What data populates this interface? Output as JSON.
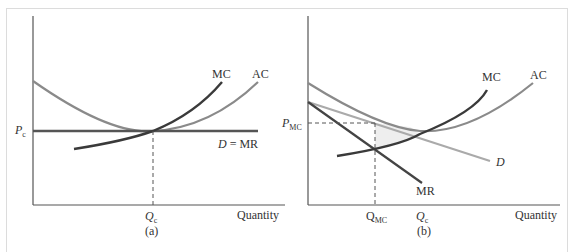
{
  "panels": [
    {
      "id": "a",
      "caption": "(a)",
      "x_axis_label": "Quantity",
      "price_label": "P",
      "price_sub": "c",
      "quantity_labels": [
        {
          "main": "Q",
          "sub": "c"
        }
      ],
      "curve_labels": {
        "mc": "MC",
        "ac": "AC",
        "demand": "D = MR"
      }
    },
    {
      "id": "b",
      "caption": "(b)",
      "x_axis_label": "Quantity",
      "price_label": "P",
      "price_sub": "MC",
      "quantity_labels": [
        {
          "main": "Q",
          "sub": "MC"
        },
        {
          "main": "Q",
          "sub": "c"
        }
      ],
      "curve_labels": {
        "mc": "MC",
        "ac": "AC",
        "demand": "D",
        "mr": "MR"
      }
    }
  ],
  "colors": {
    "axis": "#555555",
    "mc": "#3a3a3a",
    "ac": "#8a8a8a",
    "demand_a": "#555555",
    "demand_b": "#aaaaaa",
    "mr": "#444444",
    "shade": "#eeeeee",
    "frame": "#dcdcdc"
  }
}
